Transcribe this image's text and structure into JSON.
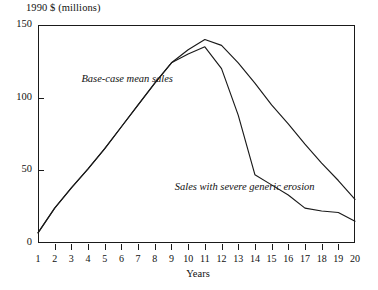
{
  "chart_data": {
    "type": "line",
    "title": "",
    "ylabel": "1990 $ (millions)",
    "xlabel": "Years",
    "xlim": [
      1,
      20
    ],
    "ylim": [
      0,
      150
    ],
    "grid": false,
    "legend_position": "inline-annotations",
    "x": [
      1,
      2,
      3,
      4,
      5,
      6,
      7,
      8,
      9,
      10,
      11,
      12,
      13,
      14,
      15,
      16,
      17,
      18,
      19,
      20
    ],
    "xticklabels": [
      "1",
      "2",
      "3",
      "4",
      "5",
      "6",
      "7",
      "8",
      "9",
      "10",
      "11",
      "12",
      "13",
      "14",
      "15",
      "16",
      "17",
      "18",
      "19",
      "20"
    ],
    "yticks": [
      0,
      50,
      100,
      150
    ],
    "yticklabels": [
      "0",
      "50",
      "100",
      "150"
    ],
    "series": [
      {
        "name": "Base-case mean sales",
        "values": [
          7,
          24,
          38,
          51,
          65,
          80,
          95,
          110,
          124,
          133,
          140,
          136,
          124,
          110,
          95,
          82,
          68,
          55,
          43,
          30
        ]
      },
      {
        "name": "Sales with severe generic erosion",
        "values": [
          7,
          24,
          38,
          51,
          65,
          80,
          95,
          110,
          124,
          130,
          135,
          120,
          88,
          47,
          40,
          33,
          24,
          22,
          21,
          15
        ]
      }
    ],
    "annotations": [
      {
        "text": "Base-case mean sales",
        "x": 3.6,
        "y": 112
      },
      {
        "text": "Sales with severe generic erosion",
        "x": 9.2,
        "y": 38
      }
    ]
  }
}
